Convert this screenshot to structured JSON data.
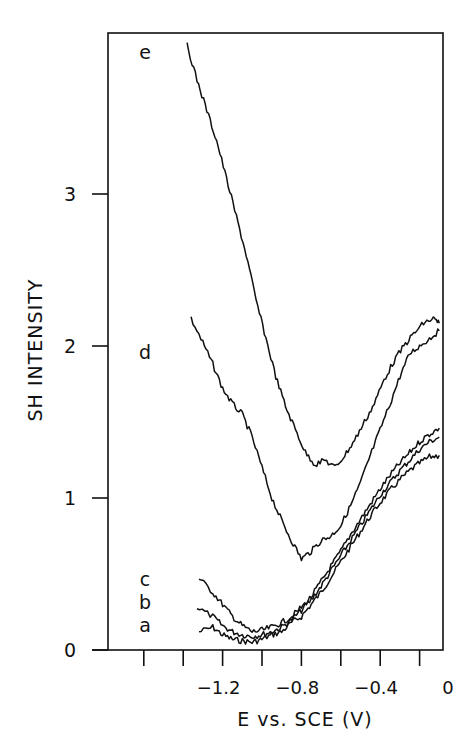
{
  "chart_data": {
    "type": "line",
    "title": "",
    "xlabel": "E vs. SCE (V)",
    "ylabel": "SH INTENSITY",
    "xlim": [
      -1.7,
      -0.07
    ],
    "ylim": [
      0,
      4.0
    ],
    "x_ticks": [
      -1.6,
      -1.4,
      -1.2,
      -1.0,
      -0.8,
      -0.6,
      -0.4,
      -0.2
    ],
    "x_tick_labels": [
      {
        "value": -1.2,
        "label": "-1.2"
      },
      {
        "value": -0.8,
        "label": "-0.8"
      },
      {
        "value": -0.4,
        "label": "-0.4"
      },
      {
        "value": 0,
        "label": "0"
      }
    ],
    "y_ticks": [
      0,
      1,
      2,
      3
    ],
    "y_tick_labels": [
      "0",
      "1",
      "2",
      "3"
    ],
    "grid": false,
    "legend": "inline curve labels at left",
    "series": [
      {
        "name": "a",
        "x": [
          -1.32,
          -1.25,
          -1.2,
          -1.15,
          -1.1,
          -1.05,
          -1.0,
          -0.95,
          -0.9,
          -0.85,
          -0.8,
          -0.75,
          -0.7,
          -0.65,
          -0.6,
          -0.55,
          -0.5,
          -0.45,
          -0.4,
          -0.35,
          -0.3,
          -0.25,
          -0.2,
          -0.15,
          -0.1
        ],
        "y": [
          0.12,
          0.15,
          0.1,
          0.07,
          0.06,
          0.05,
          0.07,
          0.1,
          0.12,
          0.18,
          0.22,
          0.3,
          0.38,
          0.48,
          0.58,
          0.68,
          0.78,
          0.88,
          0.97,
          1.05,
          1.12,
          1.18,
          1.23,
          1.27,
          1.28
        ]
      },
      {
        "name": "b",
        "x": [
          -1.33,
          -1.25,
          -1.2,
          -1.15,
          -1.1,
          -1.05,
          -1.0,
          -0.95,
          -0.9,
          -0.85,
          -0.8,
          -0.75,
          -0.7,
          -0.65,
          -0.6,
          -0.55,
          -0.5,
          -0.45,
          -0.4,
          -0.35,
          -0.3,
          -0.25,
          -0.2,
          -0.15,
          -0.1
        ],
        "y": [
          0.28,
          0.22,
          0.16,
          0.12,
          0.1,
          0.09,
          0.1,
          0.12,
          0.15,
          0.2,
          0.26,
          0.33,
          0.42,
          0.52,
          0.62,
          0.72,
          0.82,
          0.92,
          1.02,
          1.1,
          1.18,
          1.25,
          1.32,
          1.37,
          1.4
        ]
      },
      {
        "name": "c",
        "x": [
          -1.32,
          -1.25,
          -1.2,
          -1.15,
          -1.1,
          -1.05,
          -1.0,
          -0.95,
          -0.9,
          -0.85,
          -0.8,
          -0.75,
          -0.7,
          -0.65,
          -0.6,
          -0.55,
          -0.5,
          -0.45,
          -0.4,
          -0.35,
          -0.3,
          -0.25,
          -0.2,
          -0.15,
          -0.1
        ],
        "y": [
          0.47,
          0.38,
          0.3,
          0.22,
          0.16,
          0.12,
          0.13,
          0.15,
          0.18,
          0.22,
          0.28,
          0.35,
          0.45,
          0.55,
          0.65,
          0.76,
          0.86,
          0.96,
          1.06,
          1.15,
          1.23,
          1.3,
          1.37,
          1.42,
          1.46
        ]
      },
      {
        "name": "d",
        "x": [
          -1.36,
          -1.3,
          -1.25,
          -1.2,
          -1.15,
          -1.1,
          -1.05,
          -1.0,
          -0.95,
          -0.9,
          -0.85,
          -0.8,
          -0.75,
          -0.7,
          -0.65,
          -0.6,
          -0.55,
          -0.5,
          -0.45,
          -0.4,
          -0.35,
          -0.3,
          -0.25,
          -0.2,
          -0.15,
          -0.1
        ],
        "y": [
          2.18,
          2.02,
          1.88,
          1.72,
          1.62,
          1.55,
          1.4,
          1.2,
          1.0,
          0.85,
          0.72,
          0.6,
          0.65,
          0.72,
          0.75,
          0.82,
          0.95,
          1.1,
          1.28,
          1.45,
          1.62,
          1.8,
          1.95,
          2.0,
          2.05,
          2.1
        ]
      },
      {
        "name": "e",
        "x": [
          -1.38,
          -1.33,
          -1.28,
          -1.23,
          -1.18,
          -1.13,
          -1.08,
          -1.03,
          -0.98,
          -0.93,
          -0.88,
          -0.83,
          -0.78,
          -0.73,
          -0.68,
          -0.63,
          -0.58,
          -0.53,
          -0.48,
          -0.43,
          -0.38,
          -0.33,
          -0.28,
          -0.23,
          -0.18,
          -0.13,
          -0.1
        ],
        "y": [
          3.98,
          3.75,
          3.55,
          3.35,
          3.1,
          2.85,
          2.6,
          2.3,
          2.05,
          1.8,
          1.6,
          1.45,
          1.3,
          1.22,
          1.25,
          1.2,
          1.28,
          1.38,
          1.5,
          1.62,
          1.78,
          1.9,
          2.0,
          2.08,
          2.15,
          2.18,
          2.15
        ]
      }
    ],
    "annotations": [
      {
        "text": "a",
        "series": "a"
      },
      {
        "text": "b",
        "series": "b"
      },
      {
        "text": "c",
        "series": "c"
      },
      {
        "text": "d",
        "series": "d"
      },
      {
        "text": "e",
        "series": "e"
      }
    ]
  }
}
